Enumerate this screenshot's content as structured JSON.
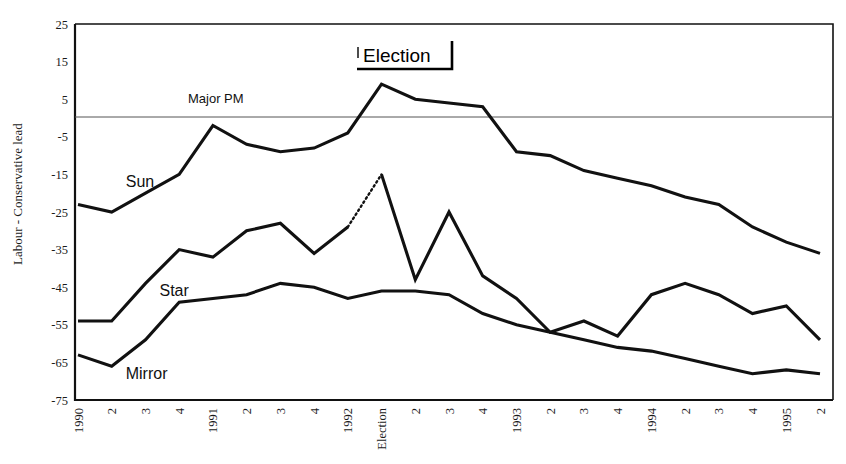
{
  "chart_data": {
    "type": "line",
    "title": "",
    "xlabel": "",
    "ylabel": "Labour - Conservative lead",
    "ylim": [
      -75,
      25
    ],
    "y_ticks": [
      25,
      15,
      5,
      -5,
      -15,
      -25,
      -35,
      -45,
      -55,
      -65,
      -75
    ],
    "grid": false,
    "legend_position": "inline-labels",
    "categories": [
      "1990",
      "2",
      "3",
      "4",
      "1991",
      "2",
      "3",
      "4",
      "1992",
      "Election",
      "2",
      "3",
      "4",
      "1993",
      "2",
      "3",
      "4",
      "1994",
      "2",
      "3",
      "4",
      "1995",
      "2"
    ],
    "series": [
      {
        "name": "Sun",
        "color": "#111111",
        "style": "solid",
        "values": [
          -23,
          -25,
          -20,
          -15,
          -2,
          -7,
          -9,
          -8,
          -4,
          9,
          5,
          4,
          3,
          -9,
          -10,
          -14,
          -16,
          -18,
          -21,
          -23,
          -29,
          -33,
          -36
        ]
      },
      {
        "name": "Star",
        "color": "#111111",
        "style": "solid-with-gap",
        "values": [
          -54,
          -54,
          -44,
          -35,
          -37,
          -30,
          -28,
          -36,
          -29,
          -15,
          -43,
          -25,
          -42,
          -48,
          -57,
          -54,
          -58,
          -47,
          -44,
          -47,
          -52,
          -50,
          -59
        ]
      },
      {
        "name": "Mirror",
        "color": "#111111",
        "style": "solid",
        "values": [
          -63,
          -66,
          -59,
          -49,
          -48,
          -47,
          -44,
          -45,
          -48,
          -46,
          -46,
          -47,
          -52,
          -55,
          -57,
          -59,
          -61,
          -62,
          -64,
          -66,
          -68,
          -67,
          -68
        ]
      }
    ],
    "annotations": [
      {
        "name": "election-bracket",
        "text": "Election",
        "x_category": "Election",
        "y_value": 18
      },
      {
        "name": "zero-reference-line",
        "text": "Major PM",
        "y_value": 0
      }
    ],
    "series_inline_labels": [
      {
        "text": "Sun",
        "x_category": "2",
        "y_value": -17
      },
      {
        "text": "Star",
        "x_category": "3",
        "y_value": -46
      },
      {
        "text": "Mirror",
        "x_category": "2",
        "y_value": -68
      }
    ]
  }
}
